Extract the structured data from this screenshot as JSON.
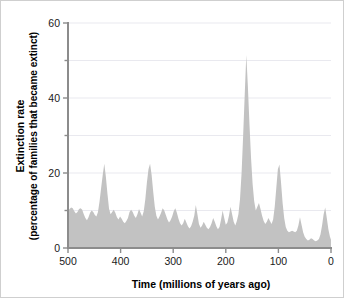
{
  "figure": {
    "background_color": "#ffffff",
    "border_color": "#cfcfcf",
    "fill_color": "#c2c2c2",
    "axis_color": "#8c8c8c",
    "grid_color": "#e9e9ef"
  },
  "chart_data": {
    "type": "area",
    "title": "",
    "xlabel": "Time  (millions of years ago)",
    "ylabel_line1": "Extinction rate",
    "ylabel_line2": "(percentage of families that became extinct)",
    "xlim": [
      500,
      0
    ],
    "ylim": [
      0,
      60
    ],
    "x_reversed": true,
    "grid": true,
    "grid_values_y": [
      10,
      20,
      30,
      40,
      50,
      60
    ],
    "legend": "none",
    "xticks": [
      500,
      400,
      300,
      200,
      100,
      0
    ],
    "xtick_labels": [
      "500",
      "400",
      "300",
      "200",
      "100",
      "0"
    ],
    "yticks": [
      0,
      20,
      40,
      60
    ],
    "ytick_labels": [
      "0",
      "20",
      "40",
      "60"
    ],
    "minor_yticks": [
      10,
      30,
      50
    ],
    "x": [
      500,
      497,
      494,
      491,
      488,
      485,
      482,
      479,
      476,
      473,
      470,
      467,
      464,
      461,
      458,
      455,
      452,
      449,
      446,
      443,
      440,
      437,
      434,
      431,
      428,
      425,
      422,
      419,
      416,
      413,
      410,
      407,
      404,
      401,
      398,
      395,
      392,
      389,
      386,
      383,
      380,
      377,
      374,
      371,
      368,
      365,
      362,
      359,
      356,
      353,
      350,
      347,
      344,
      341,
      338,
      335,
      332,
      329,
      326,
      323,
      320,
      317,
      314,
      311,
      308,
      305,
      302,
      299,
      296,
      293,
      290,
      287,
      284,
      281,
      278,
      275,
      272,
      269,
      266,
      263,
      260,
      257,
      254,
      251,
      248,
      245,
      242,
      239,
      236,
      233,
      230,
      227,
      224,
      221,
      218,
      215,
      212,
      209,
      206,
      203,
      200,
      197,
      194,
      191,
      188,
      185,
      182,
      179,
      176,
      173,
      170,
      167,
      164,
      161,
      158,
      155,
      152,
      149,
      146,
      143,
      140,
      137,
      134,
      131,
      128,
      125,
      122,
      119,
      116,
      113,
      110,
      107,
      104,
      101,
      98,
      95,
      92,
      89,
      86,
      83,
      80,
      77,
      74,
      71,
      68,
      65,
      62,
      59,
      56,
      53,
      50,
      47,
      44,
      41,
      38,
      35,
      32,
      29,
      26,
      23,
      20,
      17,
      14,
      11,
      8,
      5,
      2,
      0
    ],
    "y": [
      10.0,
      10.4,
      10.8,
      10.6,
      9.8,
      9.2,
      9.6,
      10.4,
      10.6,
      10.2,
      9.0,
      8.0,
      7.4,
      8.2,
      9.4,
      10.0,
      9.6,
      8.8,
      8.4,
      9.6,
      12.5,
      16.0,
      19.5,
      22.5,
      19.0,
      14.5,
      10.5,
      9.0,
      9.6,
      10.2,
      9.4,
      8.2,
      7.6,
      8.4,
      7.8,
      7.0,
      6.6,
      7.2,
      8.0,
      9.6,
      10.2,
      9.6,
      8.6,
      8.0,
      9.0,
      10.4,
      9.4,
      8.4,
      9.8,
      13.0,
      17.5,
      21.0,
      22.5,
      19.5,
      15.0,
      11.0,
      8.6,
      7.6,
      8.4,
      9.4,
      10.6,
      10.0,
      8.8,
      7.6,
      6.8,
      7.4,
      8.4,
      9.8,
      10.6,
      9.4,
      7.8,
      6.6,
      6.0,
      6.6,
      7.8,
      6.8,
      5.8,
      5.2,
      5.8,
      7.0,
      8.6,
      11.5,
      9.0,
      6.4,
      5.4,
      6.0,
      7.0,
      6.2,
      5.4,
      5.0,
      5.6,
      6.6,
      8.0,
      7.0,
      5.8,
      5.0,
      5.6,
      7.6,
      10.0,
      8.0,
      6.2,
      6.8,
      8.6,
      11.0,
      9.0,
      7.0,
      6.0,
      7.2,
      9.0,
      13.0,
      20.0,
      30.0,
      41.0,
      51.5,
      43.0,
      33.0,
      24.0,
      17.0,
      12.5,
      10.0,
      11.0,
      12.0,
      10.4,
      8.6,
      7.2,
      6.4,
      7.0,
      8.0,
      7.2,
      6.4,
      7.6,
      11.0,
      16.0,
      21.0,
      22.3,
      17.5,
      12.0,
      8.0,
      5.6,
      4.6,
      4.2,
      4.4,
      4.6,
      4.4,
      4.2,
      4.6,
      6.0,
      8.2,
      6.2,
      4.2,
      3.0,
      2.4,
      2.0,
      2.2,
      2.6,
      2.4,
      2.0,
      1.8,
      2.0,
      2.4,
      3.6,
      6.0,
      9.0,
      10.8,
      8.0,
      5.0,
      3.0,
      2.2,
      1.8,
      1.6,
      1.8,
      2.2,
      2.6,
      2.2,
      1.8,
      1.6,
      1.8,
      2.4,
      3.6,
      5.8,
      8.4,
      10.6,
      8.6,
      6.0,
      4.2,
      5.0,
      6.4,
      5.2,
      3.8,
      3.0,
      3.6,
      4.6,
      3.8,
      2.8,
      2.2,
      2.0,
      2.2,
      2.0,
      1.8,
      1.6,
      1.4,
      2.4,
      5.0,
      8.8,
      11.8,
      14.2,
      11.0,
      7.5,
      4.6,
      3.0,
      2.4,
      2.8,
      3.2,
      2.6,
      2.0,
      1.6,
      1.4,
      1.6,
      2.0,
      2.6,
      3.2,
      2.6,
      2.0,
      1.8,
      2.2,
      2.8,
      3.4,
      2.8,
      2.2,
      1.8,
      2.0,
      2.6,
      3.0,
      2.4,
      1.8,
      1.4,
      1.2,
      1.4,
      1.8,
      2.2,
      1.8,
      1.4,
      1.2,
      1.0,
      1.2,
      1.6,
      2.0,
      1.6,
      1.2,
      1.0,
      1.4,
      2.0,
      1.6,
      1.0,
      0.8,
      1.2,
      1.6,
      1.2,
      0.8,
      0.6,
      0.8,
      1.0,
      0.8,
      0.6
    ]
  }
}
